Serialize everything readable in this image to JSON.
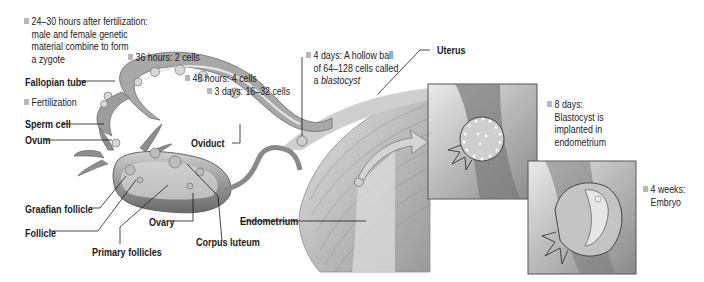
{
  "diagram": {
    "structure_labels": {
      "fallopian_tube": "Fallopian tube",
      "sperm_cell": "Sperm cell",
      "ovum": "Ovum",
      "graafian_follicle": "Graafian follicle",
      "follicle": "Follicle",
      "primary_follicles": "Primary follicles",
      "ovary": "Ovary",
      "corpus_luteum": "Corpus luteum",
      "oviduct": "Oviduct",
      "endometrium": "Endometrium",
      "uterus": "Uterus"
    },
    "stages": [
      {
        "id": "zygote",
        "lines": [
          "24–30 hours after fertilization:",
          "male and female genetic",
          "material combine to form",
          "a zygote"
        ]
      },
      {
        "id": "fertilization",
        "lines": [
          "Fertilization"
        ]
      },
      {
        "id": "two-cells",
        "lines": [
          "36 hours: 2 cells"
        ]
      },
      {
        "id": "four-cells",
        "lines": [
          "48 hours: 4 cells"
        ]
      },
      {
        "id": "morula",
        "lines": [
          "3 days: 16–32 cells"
        ]
      },
      {
        "id": "blastocyst",
        "lines": [
          "4 days: A hollow ball",
          "of 64–128 cells called"
        ],
        "italic_line": "a blastocyst",
        "italic_prefix": "a ",
        "italic_word": "blastocyst"
      },
      {
        "id": "implantation",
        "lines": [
          "8 days:",
          "Blastocyst is",
          "implanted in",
          "endometrium"
        ]
      },
      {
        "id": "embryo",
        "lines": [
          "4 weeks:",
          "Embryo"
        ]
      }
    ],
    "insets": [
      {
        "id": "inset-implantation",
        "depicts": "blastocyst implanted in endometrium"
      },
      {
        "id": "inset-embryo",
        "depicts": "4-week embryo"
      }
    ],
    "colors": {
      "bullet": "#b7b7b7",
      "tissue_dark": "#6e6e6e",
      "tissue_mid": "#a9a9a9",
      "tissue_light": "#d9d9d9",
      "leader_line": "#1a1a1a"
    }
  }
}
